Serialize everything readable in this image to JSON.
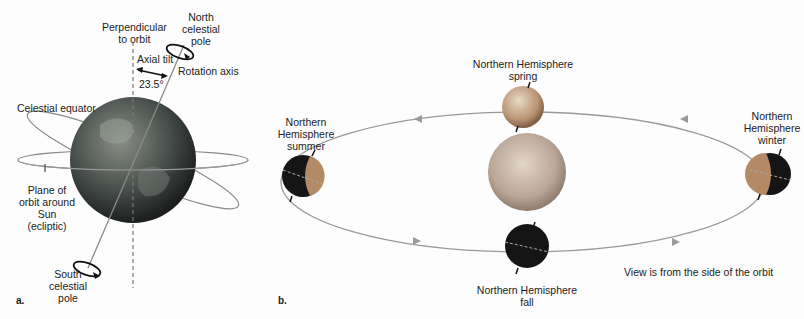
{
  "panel_a": {
    "letter": "a.",
    "labels": {
      "perpendicular": [
        "Perpendicular",
        "to orbit"
      ],
      "north_pole": [
        "North",
        "celestial",
        "pole"
      ],
      "axial_tilt": "Axial tilt",
      "tilt_angle": "23.5°",
      "rotation_axis": "Rotation axis",
      "celestial_equator": "Celestial equator",
      "ecliptic": [
        "Plane of",
        "orbit around",
        "Sun",
        "(ecliptic)"
      ],
      "south_pole": [
        "South",
        "celestial",
        "pole"
      ]
    }
  },
  "panel_b": {
    "letter": "b.",
    "seasons": {
      "spring": [
        "Northern Hemisphere",
        "spring"
      ],
      "summer": [
        "Northern",
        "Hemisphere",
        "summer"
      ],
      "winter": [
        "Northern",
        "Hemisphere",
        "winter"
      ],
      "fall": [
        "Northern Hemisphere",
        "fall"
      ]
    },
    "caption": "View is from the side of the orbit"
  },
  "colors": {
    "orbit_line": "#8a8a8a",
    "earth_dark": "#1a1a1a",
    "earth_lit": "#b08a66",
    "sun": "#c8b8a8"
  }
}
